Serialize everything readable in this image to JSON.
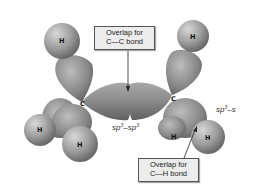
{
  "diagram": {
    "callouts": {
      "cc": {
        "line1": "Overlap for",
        "line2": "C—C bond"
      },
      "ch": {
        "line1": "Overlap for",
        "line2": "C—H bond"
      }
    },
    "overlap_labels": {
      "sp3_sp3": {
        "a": "sp",
        "a_sup": "3",
        "dash": "–",
        "b": "sp",
        "b_sup": "3"
      },
      "sp3_s": {
        "a": "sp",
        "a_sup": "3",
        "dash": "–",
        "b": "s"
      }
    },
    "atoms": {
      "carbon_left": "C",
      "carbon_right": "C",
      "h_top_left": "H",
      "h_top_right": "H",
      "h_bottom_left_1": "H",
      "h_bottom_left_2": "H",
      "h_bottom_right_1": "H",
      "h_bottom_right_2": "H"
    },
    "colors": {
      "background": "#ffffff",
      "orbital_light": "#c8c8c8",
      "orbital_dark": "#6e6e6e",
      "callout_bg": "#ececec",
      "callout_border": "#555555"
    }
  }
}
